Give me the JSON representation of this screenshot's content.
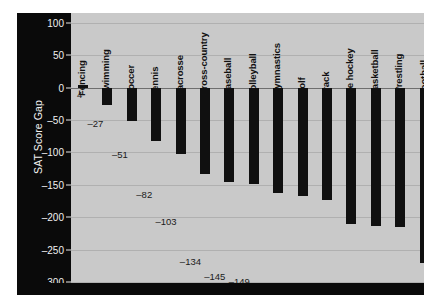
{
  "chart_data": {
    "type": "bar",
    "title": "",
    "subtitle": "",
    "xlabel": "",
    "ylabel": "SAT Score Gap",
    "ylim": [
      -320,
      115
    ],
    "yticks": [
      100,
      50,
      0,
      -50,
      -100,
      -150,
      -200,
      -250,
      -300
    ],
    "ytick_labels": [
      "100",
      "50",
      "0",
      "–50",
      "–100",
      "–150",
      "–200",
      "–250",
      "–300"
    ],
    "grid": true,
    "legend": "none",
    "orientation": "vertical",
    "bar_color": "#101010",
    "plot_background": "#c9c9c9",
    "axis_panel_color": "#0a0a0a",
    "categories": [
      "Fencing",
      "Swimming",
      "Soccer",
      "Tennis",
      "Lacrosse",
      "Cross-country",
      "Baseball",
      "Volleyball",
      "Gymnastics",
      "Golf",
      "Track",
      "Ice hockey",
      "Basketball",
      "Wrestling",
      "Football"
    ],
    "values": [
      4,
      -27,
      -51,
      -82,
      -103,
      -134,
      -145,
      -149,
      -163,
      -168,
      -173,
      -210,
      -213,
      -215,
      -271
    ],
    "value_labels": [
      "4",
      "–27",
      "–51",
      "–82",
      "–103",
      "–134",
      "–145",
      "–149",
      "–163",
      "–168",
      "–173",
      "–210",
      "–213",
      "–215",
      "–271"
    ]
  }
}
